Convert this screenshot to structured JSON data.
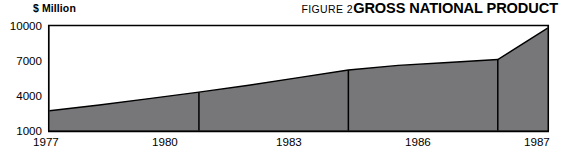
{
  "header": {
    "unit_label": "$ Million",
    "figure_number": "FIGURE 2",
    "title": "GROSS NATIONAL PRODUCT"
  },
  "colors": {
    "area_fill": "#77777a",
    "axis_line": "#000000",
    "text": "#000000",
    "background": "#ffffff"
  },
  "axis": {
    "y_ticks": [
      "1000",
      "4000",
      "7000",
      "10000"
    ],
    "x_ticks": [
      "1977",
      "1980",
      "1983",
      "1986",
      "1987"
    ]
  },
  "chart_data": {
    "type": "area",
    "title": "GROSS NATIONAL PRODUCT",
    "subtitle": "FIGURE 2",
    "xlabel": "",
    "ylabel": "$ Million",
    "grid": false,
    "legend": "none",
    "x": [
      1977,
      1978,
      1979,
      1980,
      1981,
      1982,
      1983,
      1984,
      1985,
      1986,
      1987
    ],
    "values": [
      2700,
      3200,
      3750,
      4300,
      4900,
      5550,
      6200,
      6600,
      6850,
      7100,
      9800
    ],
    "categories": [
      "1977",
      "1978",
      "1979",
      "1980",
      "1981",
      "1982",
      "1983",
      "1984",
      "1985",
      "1986",
      "1987"
    ],
    "series": [
      {
        "name": "Gross National Product",
        "values": [
          2700,
          3200,
          3750,
          4300,
          4900,
          5550,
          6200,
          6600,
          6850,
          7100,
          9800
        ]
      }
    ],
    "labeled_points": [
      {
        "year": "1977",
        "value": 2700
      },
      {
        "year": "1980",
        "value": 4300
      },
      {
        "year": "1983",
        "value": 6200
      },
      {
        "year": "1986",
        "value": 7100
      },
      {
        "year": "1987",
        "value": 9800
      }
    ],
    "vertical_markers": [
      "1980",
      "1983",
      "1986"
    ],
    "xlim": [
      1977,
      1987
    ],
    "ylim": [
      1000,
      10000
    ],
    "ytick_values": [
      1000,
      4000,
      7000,
      10000
    ],
    "xtick_values": [
      1977,
      1980,
      1983,
      1986,
      1987
    ],
    "units": "$ Million"
  }
}
